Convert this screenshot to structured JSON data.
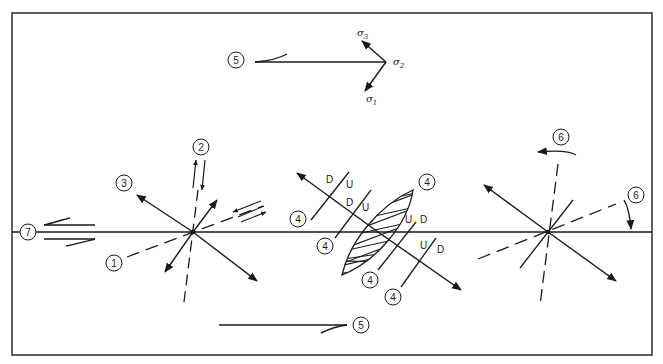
{
  "figure": {
    "stress_axes": {
      "sigma1": {
        "symbol": "σ",
        "subscript": "1"
      },
      "sigma2": {
        "symbol": "σ",
        "subscript": "2"
      },
      "sigma3": {
        "symbol": "σ",
        "subscript": "3"
      }
    },
    "callouts": [
      {
        "id": "c5-top",
        "label": "5"
      },
      {
        "id": "c2",
        "label": "2"
      },
      {
        "id": "c3",
        "label": "3"
      },
      {
        "id": "c1",
        "label": "1"
      },
      {
        "id": "c7",
        "label": "7"
      },
      {
        "id": "c4-a",
        "label": "4"
      },
      {
        "id": "c4-b",
        "label": "4"
      },
      {
        "id": "c4-c",
        "label": "4"
      },
      {
        "id": "c4-d",
        "label": "4"
      },
      {
        "id": "c4-e",
        "label": "4"
      },
      {
        "id": "c6-top",
        "label": "6"
      },
      {
        "id": "c6-right",
        "label": "6"
      },
      {
        "id": "c5-bottom",
        "label": "5"
      }
    ],
    "fault_markers": [
      {
        "id": "m1",
        "side_a": "D",
        "side_b": "U"
      },
      {
        "id": "m2",
        "side_a": "D",
        "side_b": "U"
      },
      {
        "id": "m3",
        "side_a": "U",
        "side_b": "D"
      },
      {
        "id": "m4",
        "side_a": "U",
        "side_b": "D"
      }
    ]
  }
}
